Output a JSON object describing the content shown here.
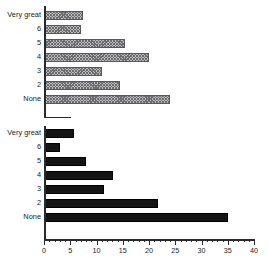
{
  "chart_data": {
    "type": "bar",
    "orientation": "horizontal",
    "title": "",
    "xlabel": "",
    "ylabel": "",
    "xlim": [
      0,
      40
    ],
    "xticks": [
      0,
      5,
      10,
      15,
      20,
      25,
      30,
      35,
      40
    ],
    "xtick_labels": [
      "0",
      "5",
      "10",
      "15",
      "20",
      "25",
      "30",
      "35",
      "40"
    ],
    "minor_tick_step": 1,
    "grid": false,
    "legend": "none",
    "categories": [
      "Very great",
      "6",
      "5",
      "4",
      "3",
      "2",
      "None"
    ],
    "panels": [
      {
        "name": "hatched-panel",
        "style": "hatched",
        "fill_color": "#b9b9bb",
        "edge_color": "#58585a",
        "categories": [
          "Very great",
          "6",
          "5",
          "4",
          "3",
          "2",
          "None"
        ],
        "values": [
          7.5,
          7,
          15.5,
          20,
          11,
          14.5,
          24
        ]
      },
      {
        "name": "solid-panel",
        "style": "solid",
        "fill_color": "#141414",
        "edge_color": "#000000",
        "categories": [
          "Very great",
          "6",
          "5",
          "4",
          "3",
          "2",
          "None"
        ],
        "values": [
          5.7,
          3,
          8,
          13.2,
          11.4,
          21.8,
          35
        ]
      }
    ]
  },
  "axis": {
    "x_min": 0,
    "x_max": 40,
    "tick_labels": [
      "0",
      "5",
      "10",
      "15",
      "20",
      "25",
      "30",
      "35",
      "40"
    ]
  }
}
